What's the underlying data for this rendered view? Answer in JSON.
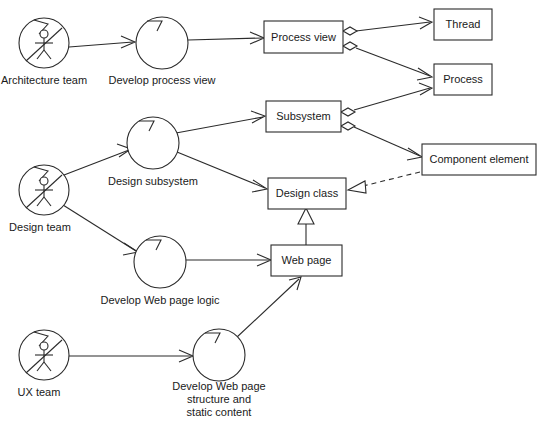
{
  "diagram": {
    "type": "uml-activity-diagram",
    "canvas": {
      "width": 542,
      "height": 428,
      "background": "#ffffff"
    },
    "line_color": "#2b2b2b",
    "text_color": "#1a1a1a"
  },
  "actors": [
    {
      "id": "actor-architecture-team",
      "label": "Architecture team",
      "icon": "actor-role-icon",
      "cx": 44,
      "cy": 43,
      "r": 25,
      "label_x": 44,
      "label_y": 80
    },
    {
      "id": "actor-design-team",
      "label": "Design team",
      "icon": "actor-role-icon",
      "cx": 44,
      "cy": 190,
      "r": 25,
      "label_x": 40,
      "label_y": 227
    },
    {
      "id": "actor-ux-team",
      "label": "UX team",
      "icon": "actor-role-icon",
      "cx": 44,
      "cy": 355,
      "r": 25,
      "label_x": 39,
      "label_y": 392
    }
  ],
  "activities": [
    {
      "id": "activity-develop-process-view",
      "label": "Develop process view",
      "cx": 162,
      "cy": 43,
      "r": 26,
      "label_lines": [
        "Develop process view"
      ],
      "label_x": 162,
      "label_y": 80
    },
    {
      "id": "activity-design-subsystem",
      "label": "Design subsystem",
      "cx": 153,
      "cy": 143,
      "r": 26,
      "label_lines": [
        "Design subsystem"
      ],
      "label_x": 153,
      "label_y": 181
    },
    {
      "id": "activity-develop-web-page-logic",
      "label": "Develop Web page logic",
      "cx": 160,
      "cy": 262,
      "r": 26,
      "label_lines": [
        "Develop Web page logic"
      ],
      "label_x": 160,
      "label_y": 300
    },
    {
      "id": "activity-develop-web-page-structure",
      "label": "Develop Web page structure and static content",
      "cx": 219,
      "cy": 355,
      "r": 26,
      "label_lines": [
        "Develop Web page",
        "structure and",
        "static content"
      ],
      "label_x": 219,
      "label_y": 390
    }
  ],
  "classes": [
    {
      "id": "class-process-view",
      "label": "Process view",
      "x": 264,
      "y": 21,
      "width": 79,
      "height": 32
    },
    {
      "id": "class-thread",
      "label": "Thread",
      "x": 434,
      "y": 9,
      "width": 58,
      "height": 31
    },
    {
      "id": "class-process",
      "label": "Process",
      "x": 434,
      "y": 64,
      "width": 58,
      "height": 31
    },
    {
      "id": "class-subsystem",
      "label": "Subsystem",
      "x": 266,
      "y": 101,
      "width": 75,
      "height": 31
    },
    {
      "id": "class-component-element",
      "label": "Component element",
      "x": 422,
      "y": 144,
      "width": 114,
      "height": 31
    },
    {
      "id": "class-design-class",
      "label": "Design class",
      "x": 268,
      "y": 178,
      "width": 78,
      "height": 31
    },
    {
      "id": "class-web-page",
      "label": "Web page",
      "x": 271,
      "y": 245,
      "width": 71,
      "height": 31
    }
  ],
  "edges": [
    {
      "id": "edge-architecture-team-to-develop-process-view",
      "from": "actor-architecture-team",
      "to": "activity-develop-process-view",
      "style": "solid",
      "head": "open-arrow"
    },
    {
      "id": "edge-develop-process-view-to-process-view",
      "from": "activity-develop-process-view",
      "to": "class-process-view",
      "style": "solid",
      "head": "open-arrow"
    },
    {
      "id": "edge-process-view-to-thread",
      "from": "class-process-view",
      "to": "class-thread",
      "style": "solid",
      "head": "open-arrow",
      "tail": "aggregation-diamond"
    },
    {
      "id": "edge-process-view-to-process",
      "from": "class-process-view",
      "to": "class-process",
      "style": "solid",
      "head": "open-arrow",
      "tail": "aggregation-diamond"
    },
    {
      "id": "edge-design-team-to-design-subsystem",
      "from": "actor-design-team",
      "to": "activity-design-subsystem",
      "style": "solid",
      "head": "open-arrow"
    },
    {
      "id": "edge-design-subsystem-to-subsystem",
      "from": "activity-design-subsystem",
      "to": "class-subsystem",
      "style": "solid",
      "head": "open-arrow"
    },
    {
      "id": "edge-design-subsystem-to-design-class",
      "from": "activity-design-subsystem",
      "to": "class-design-class",
      "style": "solid",
      "head": "open-arrow"
    },
    {
      "id": "edge-subsystem-to-process",
      "from": "class-subsystem",
      "to": "class-process",
      "style": "solid",
      "head": "open-arrow",
      "tail": "aggregation-diamond"
    },
    {
      "id": "edge-subsystem-to-component-element",
      "from": "class-subsystem",
      "to": "class-component-element",
      "style": "solid",
      "head": "open-arrow",
      "tail": "aggregation-diamond"
    },
    {
      "id": "edge-component-element-to-design-class",
      "from": "class-component-element",
      "to": "class-design-class",
      "style": "dashed",
      "head": "hollow-triangle"
    },
    {
      "id": "edge-design-team-to-develop-web-page-logic",
      "from": "actor-design-team",
      "to": "activity-develop-web-page-logic",
      "style": "solid",
      "head": "open-arrow"
    },
    {
      "id": "edge-develop-web-page-logic-to-web-page",
      "from": "activity-develop-web-page-logic",
      "to": "class-web-page",
      "style": "solid",
      "head": "open-arrow"
    },
    {
      "id": "edge-web-page-to-design-class",
      "from": "class-web-page",
      "to": "class-design-class",
      "style": "solid",
      "head": "hollow-triangle"
    },
    {
      "id": "edge-ux-team-to-develop-web-page-structure",
      "from": "actor-ux-team",
      "to": "activity-develop-web-page-structure",
      "style": "solid",
      "head": "open-arrow"
    },
    {
      "id": "edge-develop-web-page-structure-to-web-page",
      "from": "activity-develop-web-page-structure",
      "to": "class-web-page",
      "style": "solid",
      "head": "open-arrow"
    }
  ]
}
